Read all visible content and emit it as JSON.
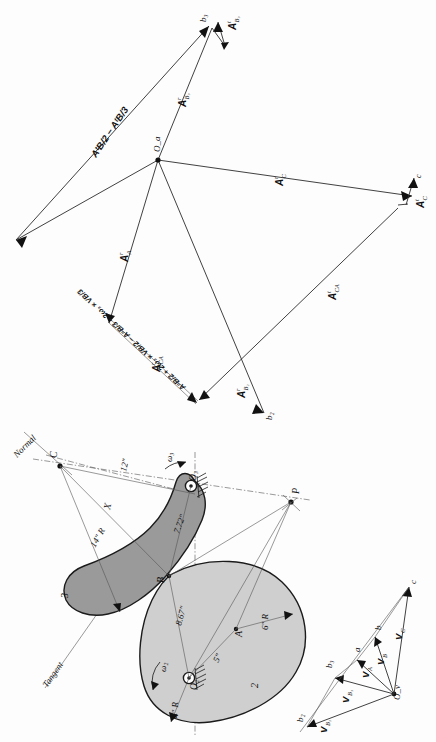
{
  "figure": {
    "domain": "engineering-kinematics-diagram",
    "orientation_note": "Figure content is rotated 90 degrees counter-clockwise on the page",
    "ink_color": "#111111",
    "cam2_fill": "#cfcfcf",
    "link3_fill": "#9a9a9a"
  },
  "mechanism": {
    "caption": "Mechanism skeleton",
    "links": [
      {
        "id": "link-2",
        "label": "2",
        "description": "cam, lower shaded body"
      },
      {
        "id": "link-3",
        "label": "3",
        "description": "follower arm, darker shaded body"
      }
    ],
    "points": [
      {
        "name": "O2",
        "label": "O₂",
        "role": "fixed pivot of link 2"
      },
      {
        "name": "O3",
        "label": "O₃",
        "role": "fixed pivot of link 3"
      },
      {
        "name": "A",
        "label": "A",
        "role": "cam profile centre"
      },
      {
        "name": "B",
        "label": "B",
        "role": "contact point"
      },
      {
        "name": "C",
        "label": "C",
        "role": "centre of curvature"
      },
      {
        "name": "P",
        "label": "P",
        "role": "instant centre"
      }
    ],
    "angular_velocities": [
      {
        "name": "omega2",
        "label": "ω₂",
        "link": "2"
      },
      {
        "name": "omega3",
        "label": "ω₃",
        "link": "3"
      }
    ],
    "dimensions": [
      {
        "name": "radius-4in",
        "label": "4\" R",
        "value": 4,
        "unit": "in",
        "kind": "radius"
      },
      {
        "name": "radius-6in",
        "label": "6\" R",
        "value": 6,
        "unit": "in",
        "kind": "radius"
      },
      {
        "name": "radius-14in",
        "label": "14\" R",
        "value": 14,
        "unit": "in",
        "kind": "radius"
      },
      {
        "name": "dim-5in",
        "label": "5\"",
        "value": 5,
        "unit": "in",
        "kind": "length"
      },
      {
        "name": "dim-8-67in",
        "label": "8.67\"",
        "value": 8.67,
        "unit": "in",
        "kind": "length"
      },
      {
        "name": "dim-7-72in",
        "label": "7.72\"",
        "value": 7.72,
        "unit": "in",
        "kind": "length"
      },
      {
        "name": "dim-12in",
        "label": "12\"",
        "value": 12,
        "unit": "in",
        "kind": "length"
      },
      {
        "name": "dim-X",
        "label": "X",
        "value": null,
        "unit": "",
        "kind": "unknown-length"
      }
    ],
    "construction_lines": [
      {
        "name": "normal-line",
        "label": "Normal"
      },
      {
        "name": "tangent-line",
        "label": "Tangent"
      }
    ]
  },
  "velocity_polygon": {
    "caption": "Velocity polygon",
    "pole": {
      "name": "Ov",
      "label": "O_v"
    },
    "terminals": [
      {
        "name": "a",
        "label": "a"
      },
      {
        "name": "b",
        "label": "b"
      },
      {
        "name": "c",
        "label": "c"
      },
      {
        "name": "b2",
        "label": "b₂"
      },
      {
        "name": "b3",
        "label": "b₃"
      }
    ],
    "vectors": [
      {
        "name": "V_A",
        "label": "V",
        "sub": "A"
      },
      {
        "name": "V_B",
        "label": "V",
        "sub": "B"
      },
      {
        "name": "V_C",
        "label": "V",
        "sub": "C"
      },
      {
        "name": "V_B2",
        "label": "V",
        "sub": "B₂"
      },
      {
        "name": "V_B3",
        "label": "V",
        "sub": "B₃"
      }
    ]
  },
  "acceleration_polygon": {
    "caption": "Acceleration polygon",
    "pole": {
      "name": "Oa",
      "label": "O_a"
    },
    "terminals": [
      {
        "name": "b2",
        "label": "b₂"
      },
      {
        "name": "b3",
        "label": "b₃"
      },
      {
        "name": "c",
        "label": "c"
      }
    ],
    "vectors": [
      {
        "name": "A_r_A",
        "label": "A",
        "sup": "r",
        "sub": "A"
      },
      {
        "name": "A_r_C",
        "label": "A",
        "sup": "r",
        "sub": "C"
      },
      {
        "name": "A_t_C",
        "label": "A",
        "sup": "t",
        "sub": "C"
      },
      {
        "name": "A_t_CA",
        "label": "A",
        "sup": "t",
        "sub": "CA"
      },
      {
        "name": "A_r_CA",
        "label": "A",
        "sup": "r",
        "sub": "CA"
      },
      {
        "name": "A_r_B3",
        "label": "A",
        "sup": "r",
        "sub": "B₃"
      },
      {
        "name": "A_t_B3",
        "label": "A",
        "sup": "t",
        "sub": "B₃"
      },
      {
        "name": "A_r_B2",
        "label": "A",
        "sup": "r",
        "sub": "B₂"
      }
    ],
    "annotations": [
      {
        "name": "tangential-difference",
        "text": "AᵗB/2 − AᵗB/3",
        "reading": "A t B/2 minus A t B/3"
      },
      {
        "name": "coriolis-expression",
        "text": "AⁿB/2 + 2ω₃ × VB/2 − AⁿB/3 − 2ω₃ × VB/3",
        "reading": "A n B/2 plus 2 omega3 cross V B/2 minus A n B/3 minus 2 omega3 cross V B/3"
      }
    ]
  }
}
